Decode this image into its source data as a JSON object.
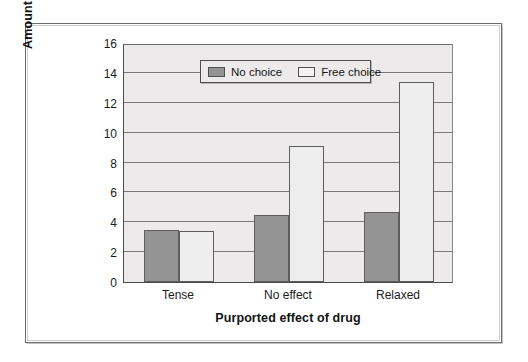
{
  "chart_data": {
    "type": "bar",
    "title": "",
    "xlabel": "Purported effect of drug",
    "ylabel": "Amount of attitude change",
    "categories": [
      "Tense",
      "No effect",
      "Relaxed"
    ],
    "series": [
      {
        "name": "No choice",
        "color": "#949494",
        "values": [
          3.5,
          4.5,
          4.7
        ]
      },
      {
        "name": "Free choice",
        "color": "#eeeded",
        "values": [
          3.4,
          9.1,
          13.4
        ]
      }
    ],
    "ylim": [
      0,
      16
    ],
    "yticks": [
      0,
      2,
      4,
      6,
      8,
      10,
      12,
      14,
      16
    ],
    "ytick_labels": [
      "0",
      "2",
      "4",
      "6",
      "8",
      "10",
      "12",
      "14",
      "16"
    ],
    "grid": true,
    "legend_position": "upper center",
    "plot_background": "#eceaea",
    "axis_color": "#4a4a4a"
  },
  "legend": {
    "entries": [
      {
        "label": "No choice",
        "swatch": "dark"
      },
      {
        "label": "Free choice",
        "swatch": "light"
      }
    ]
  }
}
